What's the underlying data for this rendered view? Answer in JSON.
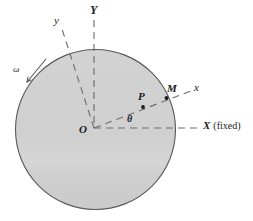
{
  "figure": {
    "kind": "physics-diagram",
    "background_color": "#ffffff",
    "disk": {
      "name": "rotating-disk",
      "fill_color": "#cfcfcf",
      "stroke_color": "#555555",
      "center_x": 95.5,
      "center_y": 129.5,
      "radius": 80
    },
    "labels": {
      "fixed_axis_vertical": "Y",
      "body_axis_vertical": "y",
      "angular_velocity": "ω",
      "body_axis_horizontal": "x",
      "point_on_rim": "M",
      "point_interior": "P",
      "angle": "θ",
      "origin": "O",
      "fixed_axis_horizontal_letter": "X",
      "fixed_axis_horizontal_note": "(fixed)"
    },
    "geometry": {
      "origin_x": 94,
      "origin_y": 128,
      "rotation_angle_deg": 21,
      "fixed_x_axis_end_x": 200,
      "fixed_y_axis_top_y": 20,
      "body_x_axis_end_x": 190,
      "body_x_axis_end_y": 92,
      "body_y_axis_end_x": 62,
      "body_y_axis_end_y": 27,
      "point_P_x": 143,
      "point_P_y": 107,
      "point_M_x": 166,
      "point_M_y": 98
    },
    "colors": {
      "line": "#555555",
      "dash": "#6b6b6b",
      "text": "#1a1a1a",
      "disk_fill": "#cfcfcf"
    }
  }
}
